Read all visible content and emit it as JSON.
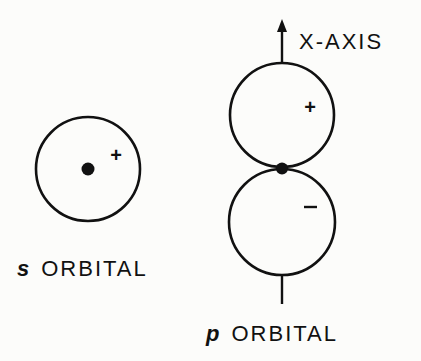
{
  "diagram": {
    "colors": {
      "background": "#fcfcfa",
      "ink": "#111111"
    },
    "s_orbital": {
      "letter": "s",
      "label": "ORBITAL",
      "sign": "+",
      "shape": "sphere (circle) with nucleus at center"
    },
    "p_orbital": {
      "letter": "p",
      "label": "ORBITAL",
      "axis_label": "X-AXIS",
      "upper_lobe_sign": "+",
      "lower_lobe_sign": "−",
      "shape": "two lobes touching at nucleus along axis"
    }
  }
}
